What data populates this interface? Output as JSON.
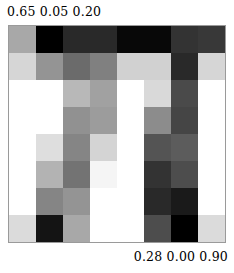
{
  "figure": {
    "top_left_caption": "0.65 0.05 0.20",
    "bottom_right_caption": "0.28 0.00 0.90"
  },
  "chart_data": {
    "type": "heatmap",
    "title": "",
    "subtitle": "",
    "xlabel": "",
    "ylabel": "",
    "annotations": [
      {
        "position": "top-left",
        "text": "0.65 0.05 0.20"
      },
      {
        "position": "bottom-right",
        "text": "0.28 0.00 0.90"
      }
    ],
    "grid": false,
    "legend": "none",
    "colormap": "gray",
    "rows": 8,
    "cols": 8,
    "vmin": 0.0,
    "vmax": 1.0,
    "note": "Intensity values are normalized 0 (black) to 1 (white) grayscale levels read off each cell.",
    "values": [
      [
        0.66,
        0.0,
        0.16,
        0.16,
        0.03,
        0.03,
        0.2,
        0.22
      ],
      [
        0.84,
        0.58,
        0.42,
        0.5,
        0.82,
        0.82,
        0.16,
        0.84
      ],
      [
        1.0,
        1.0,
        0.72,
        0.63,
        1.0,
        0.85,
        0.29,
        1.0
      ],
      [
        1.0,
        1.0,
        0.57,
        0.61,
        1.0,
        0.55,
        0.27,
        1.0
      ],
      [
        1.0,
        0.87,
        0.52,
        0.83,
        1.0,
        0.33,
        0.36,
        1.0
      ],
      [
        1.0,
        0.7,
        0.45,
        0.96,
        1.0,
        0.2,
        0.3,
        1.0
      ],
      [
        1.0,
        0.52,
        0.58,
        1.0,
        1.0,
        0.16,
        0.1,
        1.0
      ],
      [
        0.86,
        0.08,
        0.66,
        1.0,
        1.0,
        0.3,
        0.0,
        0.86
      ]
    ],
    "colors": [
      [
        "#a8a8a8",
        "#000000",
        "#292929",
        "#292929",
        "#080808",
        "#080808",
        "#333333",
        "#383838"
      ],
      [
        "#d6d6d6",
        "#949494",
        "#6b6b6b",
        "#808080",
        "#d1d1d1",
        "#d1d1d1",
        "#292929",
        "#d6d6d6"
      ],
      [
        "#ffffff",
        "#ffffff",
        "#b8b8b8",
        "#a1a1a1",
        "#ffffff",
        "#d9d9d9",
        "#4a4a4a",
        "#ffffff"
      ],
      [
        "#ffffff",
        "#ffffff",
        "#919191",
        "#9c9c9c",
        "#ffffff",
        "#8c8c8c",
        "#454545",
        "#ffffff"
      ],
      [
        "#ffffff",
        "#dedede",
        "#858585",
        "#d4d4d4",
        "#ffffff",
        "#545454",
        "#5c5c5c",
        "#ffffff"
      ],
      [
        "#ffffff",
        "#b3b3b3",
        "#737373",
        "#f5f5f5",
        "#ffffff",
        "#333333",
        "#4d4d4d",
        "#ffffff"
      ],
      [
        "#ffffff",
        "#858585",
        "#949494",
        "#ffffff",
        "#ffffff",
        "#292929",
        "#1a1a1a",
        "#ffffff"
      ],
      [
        "#dbdbdb",
        "#141414",
        "#a8a8a8",
        "#ffffff",
        "#ffffff",
        "#4d4d4d",
        "#000000",
        "#dbdbdb"
      ]
    ]
  }
}
